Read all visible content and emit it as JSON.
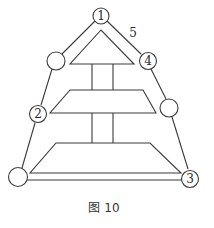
{
  "figure": {
    "caption": "图 10",
    "edge_label": "5",
    "nodes": [
      {
        "id": "top",
        "label": "1"
      },
      {
        "id": "upper-left",
        "label": ""
      },
      {
        "id": "upper-right",
        "label": "4"
      },
      {
        "id": "middle-left",
        "label": "2"
      },
      {
        "id": "middle-right",
        "label": ""
      },
      {
        "id": "bottom-left",
        "label": ""
      },
      {
        "id": "bottom-right",
        "label": "3"
      }
    ]
  }
}
